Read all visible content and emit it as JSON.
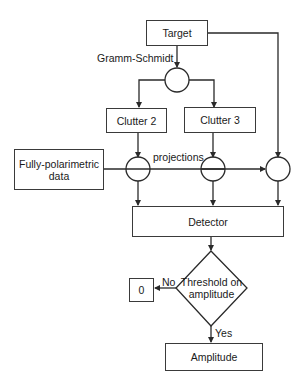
{
  "diagram": {
    "type": "flowchart",
    "nodes": {
      "target": "Target",
      "clutter2": "Clutter 2",
      "clutter3": "Clutter 3",
      "data_line1": "Fully-polarimetric",
      "data_line2": "data",
      "detector": "Detector",
      "threshold_line1": "Threshold on",
      "threshold_line2": "amplitude",
      "zero": "0",
      "amplitude": "Amplitude"
    },
    "labels": {
      "gramm_schmidt": "Gramm-Schmidt",
      "projections": "projections",
      "no": "No",
      "yes": "Yes"
    },
    "colors": {
      "stroke": "#2a2a2a",
      "background": "#ffffff"
    }
  }
}
